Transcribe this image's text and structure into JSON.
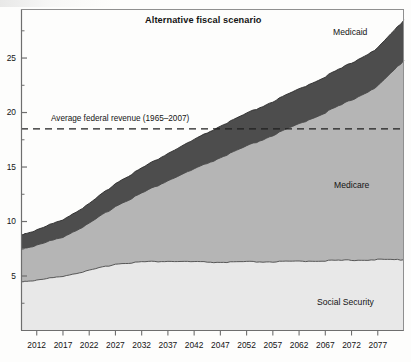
{
  "figure": {
    "title": "Alternative fiscal scenario"
  },
  "annotations": {
    "revenue_line_label": "Average federal revenue (1965–2007)",
    "medicaid_label": "Medicaid",
    "medicare_label": "Medicare",
    "social_security_label": "Social Security"
  },
  "colors": {
    "medicaid": "#4d4d4d",
    "medicare": "#b5b5b5",
    "social_security": "#e8e8e8",
    "axis": "#6e6e6e",
    "line": "#333333",
    "background": "#fdfdfc",
    "text": "#141414"
  },
  "chart_data": {
    "type": "area",
    "title": "Alternative fiscal scenario",
    "xlabel": "",
    "ylabel": "",
    "xlim": [
      2009,
      2082
    ],
    "ylim": [
      0,
      29.5
    ],
    "grid": false,
    "legend": "inline-annotations",
    "stacked": true,
    "yticks": [
      5,
      10,
      15,
      20,
      25
    ],
    "ytick_labels": [
      "5",
      "10",
      "15",
      "20",
      "25"
    ],
    "xticks": [
      2012,
      2017,
      2022,
      2027,
      2032,
      2037,
      2042,
      2047,
      2052,
      2057,
      2062,
      2067,
      2072,
      2077
    ],
    "xtick_labels": [
      "2012",
      "2017",
      "2022",
      "2027",
      "2032",
      "2037",
      "2042",
      "2047",
      "2052",
      "2057",
      "2062",
      "2067",
      "2072",
      "2077"
    ],
    "x": [
      2009,
      2012,
      2017,
      2022,
      2027,
      2032,
      2037,
      2042,
      2047,
      2052,
      2057,
      2062,
      2067,
      2072,
      2077,
      2082
    ],
    "series": [
      {
        "name": "Social Security",
        "color": "#e8e8e8",
        "values": [
          4.5,
          4.6,
          5.0,
          5.5,
          6.1,
          6.3,
          6.35,
          6.3,
          6.25,
          6.3,
          6.3,
          6.35,
          6.4,
          6.45,
          6.5,
          6.5
        ]
      },
      {
        "name": "Medicare",
        "color": "#b5b5b5",
        "values": [
          3.0,
          3.2,
          3.6,
          4.3,
          5.3,
          6.3,
          7.4,
          8.5,
          9.6,
          10.6,
          11.6,
          12.6,
          13.6,
          14.7,
          15.9,
          18.3
        ]
      },
      {
        "name": "Medicaid",
        "color": "#4d4d4d",
        "values": [
          1.3,
          1.4,
          1.6,
          1.8,
          2.1,
          2.3,
          2.5,
          2.7,
          2.9,
          3.0,
          3.1,
          3.2,
          3.3,
          3.4,
          3.5,
          3.7
        ]
      }
    ],
    "cumulative_totals": {
      "social_security": [
        4.5,
        4.6,
        5.0,
        5.5,
        6.1,
        6.3,
        6.35,
        6.3,
        6.25,
        6.3,
        6.3,
        6.35,
        6.4,
        6.45,
        6.5,
        6.5
      ],
      "plus_medicare": [
        7.5,
        7.8,
        8.6,
        9.8,
        11.4,
        12.6,
        13.75,
        14.8,
        15.85,
        16.9,
        17.9,
        18.95,
        20.0,
        21.15,
        22.4,
        24.8
      ],
      "plus_medicaid": [
        8.8,
        9.2,
        10.2,
        11.6,
        13.5,
        14.9,
        16.25,
        17.5,
        18.75,
        19.9,
        21.0,
        22.15,
        23.3,
        24.55,
        25.9,
        28.5
      ]
    },
    "reference_line": {
      "label": "Average federal revenue (1965–2007)",
      "value": 18.5,
      "style": "dashed"
    }
  }
}
